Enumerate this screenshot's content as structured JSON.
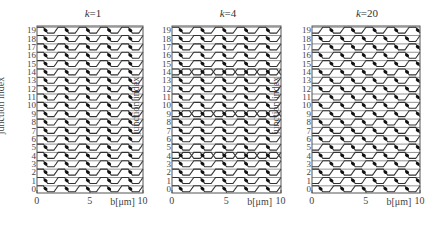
{
  "figure": {
    "y_axis_label": "junction index",
    "x_axis_label": "b[μm]",
    "x_ticks": [
      "0",
      "5",
      "10"
    ],
    "colors": {
      "line": "#333333",
      "frame": "#555555",
      "dot": "#111111",
      "background": "#ffffff"
    }
  },
  "chart_data": [
    {
      "type": "line",
      "title": "k=1",
      "title_var": "k",
      "title_value": "=1",
      "xlabel": "b[μm]",
      "ylabel": "junction index",
      "xlim": [
        0,
        10
      ],
      "ylim": [
        0,
        19
      ],
      "x_ticks": [
        0,
        5,
        10
      ],
      "y_ticks": [
        0,
        1,
        2,
        3,
        4,
        5,
        6,
        7,
        8,
        9,
        10,
        11,
        12,
        13,
        14,
        15,
        16,
        17,
        18,
        19
      ],
      "rows": 20,
      "period_um": 2,
      "pattern": "all rows identical in-phase oscillation; one dot per period on the falling edge",
      "phase_shift_per_row": 0,
      "frame": {
        "left": 37,
        "right": 143,
        "top": 26,
        "bottom": 193
      }
    },
    {
      "type": "line",
      "title": "k=4",
      "title_var": "k",
      "title_value": "=4",
      "xlabel": "b[μm]",
      "ylabel": "junction index",
      "xlim": [
        0,
        10
      ],
      "ylim": [
        0,
        19
      ],
      "x_ticks": [
        0,
        5,
        10
      ],
      "y_ticks": [
        0,
        1,
        2,
        3,
        4,
        5,
        6,
        7,
        8,
        9,
        10,
        11,
        12,
        13,
        14,
        15,
        16,
        17,
        18,
        19
      ],
      "rows": 20,
      "period_um": 2,
      "pattern": "mostly in-phase rows; every 5th row (rows 4, 9, 14) forms crossing/diamond pattern",
      "crossing_rows": [
        4,
        9,
        14
      ],
      "phase_shift_per_row": 0,
      "frame": {
        "left": 172,
        "right": 281,
        "top": 26,
        "bottom": 193
      }
    },
    {
      "type": "line",
      "title": "k=20",
      "title_var": "k",
      "title_value": "=20",
      "xlabel": "b[μm]",
      "ylabel": "junction index",
      "xlim": [
        0,
        10
      ],
      "ylim": [
        0,
        19
      ],
      "x_ticks": [
        0,
        5,
        10
      ],
      "y_ticks": [
        0,
        1,
        2,
        3,
        4,
        5,
        6,
        7,
        8,
        9,
        10,
        11,
        12,
        13,
        14,
        15,
        16,
        17,
        18,
        19
      ],
      "rows": 20,
      "period_um": 2,
      "pattern": "alternating phase every row producing a diagonal lattice / diamond mesh",
      "phase_shift_per_row": 0.5,
      "frame": {
        "left": 312,
        "right": 420,
        "top": 26,
        "bottom": 193
      }
    }
  ]
}
